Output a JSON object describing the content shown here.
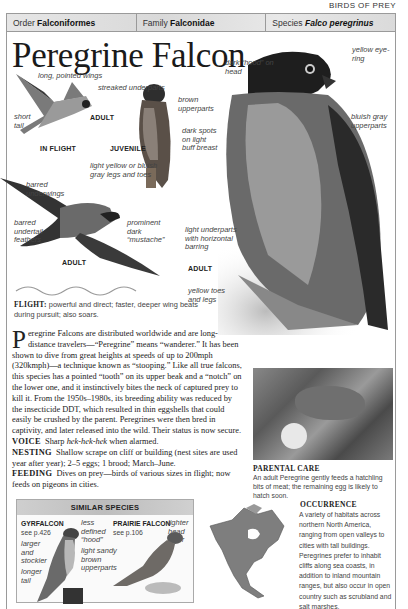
{
  "section_title": "BIRDS OF PREY",
  "taxonomy": {
    "order_label": "Order",
    "order": "Falconiformes",
    "family_label": "Family",
    "family": "Falconidae",
    "species_label": "Species",
    "species": "Falco peregrinus"
  },
  "title": "Peregrine Falcon",
  "illustrations": {
    "in_flight": {
      "caption": "IN FLIGHT",
      "age": "ADULT",
      "labels": [
        "long, pointed wings",
        "short tail"
      ]
    },
    "juvenile": {
      "caption": "JUVENILE",
      "labels": [
        "streaked underparts",
        "brown upperparts",
        "dark spots on light buff breast",
        "light yellow or bluish gray legs and toes"
      ]
    },
    "adult_flying": {
      "caption": "ADULT",
      "labels": [
        "barred underwings",
        "barred undertail feathers",
        "prominent dark “mustache”"
      ]
    },
    "adult_perched": {
      "caption": "ADULT",
      "labels": [
        "dark “hood” on head",
        "yellow eye-ring",
        "bluish gray upperparts",
        "light underparts with horizontal barring",
        "yellow toes and legs"
      ]
    }
  },
  "flight": {
    "label": "FLIGHT:",
    "text": "powerful and direct; faster, deeper wing beats during pursuit; also soars."
  },
  "description": {
    "dropcap": "P",
    "text": "eregrine Falcons are distributed worldwide and are long-distance travelers—“Peregrine” means “wanderer.” It has been shown to dive from great heights at speeds of up to 200mph (320kmph)—a technique known as “stooping.” Like all true falcons, this species has a pointed “tooth” on its upper beak and a “notch” on the lower one, and it instinctively bites the neck of captured prey to kill it. From the 1950s–1980s, its breeding ability was reduced by the insecticide DDT, which resulted in thin eggshells that could easily be crushed by the parent. Peregrines were then bred in captivity, and later released into the wild. Their status is now secure."
  },
  "facts": {
    "voice_label": "VOICE",
    "voice_pre": "Sharp ",
    "voice_call": "hek-hek-hek",
    "voice_post": " when alarmed.",
    "nesting_label": "NESTING",
    "nesting": "Shallow scrape on cliff or building (nest sites are used year after year); 2–5 eggs; 1 brood; March–June.",
    "feeding_label": "FEEDING",
    "feeding": "Dives on prey—birds of various sizes in flight; now feeds on pigeons in cities."
  },
  "parental_care": {
    "title": "PARENTAL CARE",
    "text": "An adult Peregrine gently feeds a hatchling bits of meat; the remaining egg is likely to hatch soon."
  },
  "occurrence": {
    "title": "OCCURRENCE",
    "text": "A variety of habitats across northern North America, ranging from open valleys to cities with tall buildings. Peregrines prefer to inhabit cliffs along sea coasts, in addition to inland mountain ranges, but also occur in open country such as scrubland and salt marshes."
  },
  "similar_species": {
    "title": "SIMILAR SPECIES",
    "species": [
      {
        "name": "GYRFALCON",
        "see": "see p.426",
        "labels": [
          "larger and stockier",
          "longer tail",
          "less defined “hood”"
        ]
      },
      {
        "name": "PRAIRIE FALCON",
        "see": "see p.106",
        "labels": [
          "lighter head color",
          "light sandy brown upperparts"
        ]
      }
    ]
  }
}
